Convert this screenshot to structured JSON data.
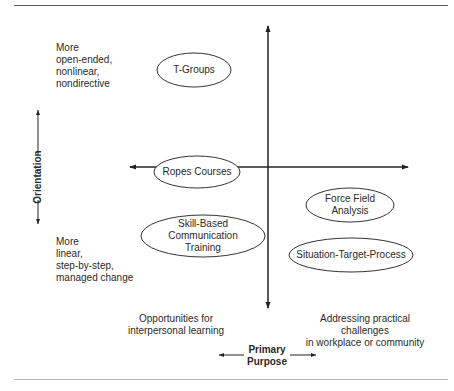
{
  "figure": {
    "type": "quadrant-diagram",
    "axes": {
      "vertical": {
        "label": "Orientation",
        "top_end": [
          "More",
          "open-ended,",
          "nonlinear,",
          "nondirective"
        ],
        "bottom_end": [
          "More",
          "linear,",
          "step-by-step,",
          "managed change"
        ]
      },
      "horizontal": {
        "label": [
          "Primary",
          "Purpose"
        ],
        "left_end": [
          "Opportunities for",
          "interpersonal learning"
        ],
        "right_end": [
          "Addressing practical challenges",
          "in workplace or community"
        ]
      }
    },
    "nodes": [
      {
        "id": "t-groups",
        "lines": [
          "T-Groups"
        ],
        "cx": 194,
        "cy": 70,
        "rx": 37,
        "ry": 17
      },
      {
        "id": "ropes-courses",
        "lines": [
          "Ropes Courses"
        ],
        "cx": 197,
        "cy": 172,
        "rx": 43,
        "ry": 16
      },
      {
        "id": "skill-based-communication-training",
        "lines": [
          "Skill-Based",
          "Communication",
          "Training"
        ],
        "cx": 203,
        "cy": 236,
        "rx": 62,
        "ry": 21
      },
      {
        "id": "force-field-analysis",
        "lines": [
          "Force Field",
          "Analysis"
        ],
        "cx": 350,
        "cy": 205,
        "rx": 44,
        "ry": 17
      },
      {
        "id": "situation-target-process",
        "lines": [
          "Situation-Target-Process"
        ],
        "cx": 351,
        "cy": 255,
        "rx": 62,
        "ry": 17
      }
    ]
  }
}
